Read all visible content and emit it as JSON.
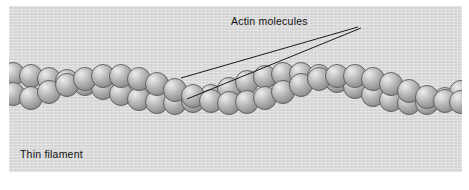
{
  "figure": {
    "background_color": "#dcdcdc",
    "page_color": "#ffffff",
    "panel": {
      "x": 9,
      "y": 6,
      "width": 453,
      "height": 166
    }
  },
  "labels": {
    "actin_molecules": "Actin molecules",
    "thin_filament": "Thin filament"
  },
  "leader_lines": [
    {
      "name": "leader-to-upper-bead",
      "from": [
        349,
        21
      ],
      "to": [
        172,
        72
      ]
    },
    {
      "name": "leader-to-lower-bead",
      "from": [
        352,
        22
      ],
      "to": [
        178,
        93
      ]
    }
  ],
  "colors": {
    "bead_highlight": "#e2e2e2",
    "bead_mid": "#b4b4b4",
    "bead_shadow": "#8f8f8f",
    "bead_outline": "#5a5a5a",
    "text": "#111111",
    "panel_bg": "#dcdcdc"
  },
  "chart_data": {
    "type": "diagram",
    "xlabel": "",
    "ylabel": "",
    "strands": [
      {
        "name": "strand-a",
        "bead_radius": 11.5,
        "beads": [
          [
            4,
            88
          ],
          [
            22,
            92
          ],
          [
            40,
            86
          ],
          [
            58,
            79
          ],
          [
            76,
            73
          ],
          [
            94,
            70
          ],
          [
            112,
            70
          ],
          [
            130,
            73
          ],
          [
            148,
            78
          ],
          [
            166,
            84
          ],
          [
            184,
            90
          ],
          [
            202,
            95
          ],
          [
            220,
            97
          ],
          [
            238,
            96
          ],
          [
            256,
            92
          ],
          [
            274,
            86
          ],
          [
            292,
            79
          ],
          [
            310,
            73
          ],
          [
            328,
            70
          ],
          [
            346,
            70
          ],
          [
            364,
            73
          ],
          [
            382,
            78
          ],
          [
            400,
            85
          ],
          [
            418,
            91
          ],
          [
            436,
            95
          ],
          [
            452,
            96
          ]
        ]
      },
      {
        "name": "strand-b",
        "bead_radius": 11.5,
        "beads": [
          [
            4,
            68
          ],
          [
            22,
            70
          ],
          [
            40,
            73
          ],
          [
            58,
            75
          ],
          [
            76,
            78
          ],
          [
            94,
            82
          ],
          [
            112,
            88
          ],
          [
            130,
            93
          ],
          [
            148,
            96
          ],
          [
            166,
            97
          ],
          [
            184,
            95
          ],
          [
            202,
            90
          ],
          [
            220,
            83
          ],
          [
            238,
            76
          ],
          [
            256,
            71
          ],
          [
            274,
            68
          ],
          [
            292,
            68
          ],
          [
            310,
            70
          ],
          [
            328,
            75
          ],
          [
            346,
            81
          ],
          [
            364,
            89
          ],
          [
            382,
            94
          ],
          [
            400,
            97
          ],
          [
            418,
            97
          ],
          [
            436,
            93
          ],
          [
            452,
            86
          ]
        ]
      }
    ],
    "annotations": [
      {
        "text": "Actin molecules",
        "anchor": [
          222,
          9
        ],
        "points_to": [
          [
            172,
            72
          ],
          [
            178,
            93
          ]
        ]
      },
      {
        "text": "Thin filament",
        "anchor": [
          11,
          142
        ],
        "points_to": []
      }
    ]
  }
}
